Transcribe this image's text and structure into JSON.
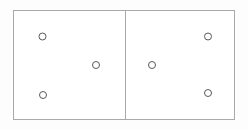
{
  "canvas": {
    "width": 248,
    "height": 129,
    "background_color": "#fdfdfd"
  },
  "diagram": {
    "title": "",
    "frame": {
      "x": 13,
      "y": 10,
      "width": 222,
      "height": 110,
      "stroke_color": "#a9a9a9",
      "fill_color": "#ffffff",
      "stroke_width": 1
    },
    "divider": {
      "x": 125,
      "y1": 10,
      "y2": 120,
      "stroke_color": "#a9a9a9",
      "stroke_width": 1
    },
    "panels": [
      {
        "name": "left-panel",
        "x": 13,
        "y": 10,
        "width": 112,
        "height": 110
      },
      {
        "name": "right-panel",
        "x": 125,
        "y": 10,
        "width": 110,
        "height": 110
      }
    ],
    "node_style": {
      "radius": 3.5,
      "stroke_color": "#5a5a5a",
      "fill_color": "#ffffff",
      "stroke_width": 1
    },
    "nodes": [
      {
        "id": "node-1",
        "panel": "left-panel",
        "cx": 42.5,
        "cy": 36.5,
        "label": ""
      },
      {
        "id": "node-2",
        "panel": "left-panel",
        "cx": 96.0,
        "cy": 65.0,
        "label": ""
      },
      {
        "id": "node-3",
        "panel": "left-panel",
        "cx": 43.0,
        "cy": 95.0,
        "label": ""
      },
      {
        "id": "node-4",
        "panel": "right-panel",
        "cx": 152.0,
        "cy": 65.0,
        "label": ""
      },
      {
        "id": "node-5",
        "panel": "right-panel",
        "cx": 208.0,
        "cy": 36.5,
        "label": ""
      },
      {
        "id": "node-6",
        "panel": "right-panel",
        "cx": 208.0,
        "cy": 93.0,
        "label": ""
      }
    ]
  }
}
